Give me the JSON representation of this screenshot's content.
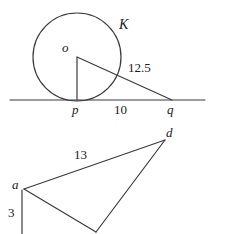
{
  "figure": {
    "stroke_color": "#3a3a42",
    "background_color": "#ffffff",
    "text_color": "#1a1a1a",
    "width": 225,
    "height": 234
  },
  "circle_figure": {
    "name": "circle-tangent-triangle",
    "circle_label": "K",
    "center_label": "o",
    "tangent_point_label": "p",
    "outer_point_label": "q",
    "hypotenuse_length": "12.5",
    "base_length": "10",
    "circle": {
      "cx": 77,
      "cy": 57,
      "r": 44
    },
    "center_point": {
      "x": 77,
      "y": 57
    },
    "tangent_point": {
      "x": 77,
      "y": 100
    },
    "outer_point": {
      "x": 172,
      "y": 100
    },
    "baseline": {
      "x1": 10,
      "y1": 100,
      "x2": 205,
      "y2": 100
    }
  },
  "triangle_figure": {
    "name": "lower-triangle",
    "vertex_a_label": "a",
    "vertex_d_label": "d",
    "side_ad_length": "13",
    "side_vertical_length": "3",
    "vertex_a": {
      "x": 24,
      "y": 189
    },
    "vertex_d": {
      "x": 165,
      "y": 140
    },
    "vertex_bottom": {
      "x": 96,
      "y": 232
    },
    "vertical_foot": {
      "x": 22,
      "y": 234
    }
  },
  "labels": {
    "K": "K",
    "o": "o",
    "p": "p",
    "q": "q",
    "twelve_point_five": "12.5",
    "ten": "10",
    "a": "a",
    "d": "d",
    "thirteen": "13",
    "three": "3"
  }
}
